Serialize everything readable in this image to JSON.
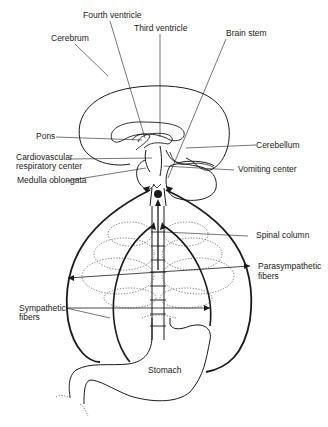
{
  "diagram": {
    "type": "anatomical-line-drawing",
    "labels": {
      "fourth_ventricle": "Fourth ventricle",
      "third_ventricle": "Third ventricle",
      "cerebrum": "Cerebrum",
      "brain_stem": "Brain stem",
      "pons": "Pons",
      "cerebellum": "Cerebellum",
      "cardio_line1": "Cardiovascular",
      "cardio_line2": "respiratory center",
      "vomiting_center": "Vomiting center",
      "medulla": "Medulla oblongata",
      "spinal_column": "Spinal column",
      "parasym_line1": "Parasympathetic",
      "parasym_line2": "fibers",
      "sym_line1": "Sympathetic",
      "sym_line2": "fibers",
      "stomach": "Stomach"
    },
    "colors": {
      "ink": "#1a1a1a",
      "background": "#ffffff"
    }
  }
}
